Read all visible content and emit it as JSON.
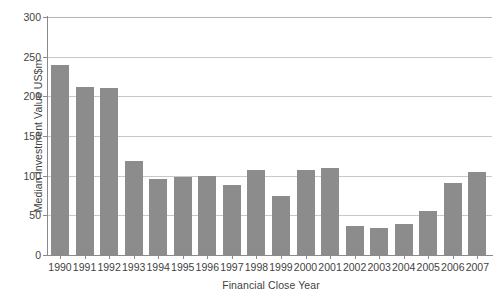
{
  "chart_data": {
    "type": "bar",
    "title": "",
    "xlabel": "Financial Close Year",
    "ylabel": "Median Investment Value US$m",
    "categories": [
      "1990",
      "1991",
      "1992",
      "1993",
      "1994",
      "1995",
      "1996",
      "1997",
      "1998",
      "1999",
      "2000",
      "2001",
      "2002",
      "2003",
      "2004",
      "2005",
      "2006",
      "2007"
    ],
    "values": [
      240,
      212,
      210,
      118,
      96,
      98,
      99,
      88,
      107,
      74,
      107,
      110,
      37,
      34,
      39,
      55,
      91,
      105
    ],
    "ylim": [
      0,
      300
    ],
    "ytick_labels": [
      "0",
      "50",
      "100",
      "150",
      "200",
      "250",
      "300"
    ],
    "ytick_values": [
      0,
      50,
      100,
      150,
      200,
      250,
      300
    ],
    "grid": "horizontal",
    "legend": "none",
    "series_color": "#8c8c8c",
    "grid_color": "#c8c8c8",
    "axis_color": "#8a8a8a",
    "background": "#ffffff"
  }
}
